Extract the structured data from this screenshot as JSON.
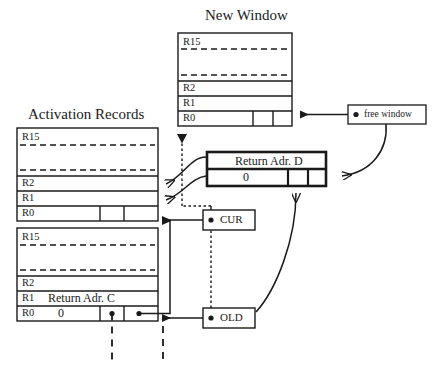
{
  "diagram": {
    "type": "register-window-activation-record-diagram",
    "titles": {
      "new_window": "New Window",
      "activation_records": "Activation Records"
    },
    "new_window": {
      "name": "New Window",
      "registers": [
        "R15",
        "R2",
        "R1",
        "R0"
      ],
      "dashed_separators": 2,
      "r0_cells": [
        "",
        "",
        ""
      ],
      "r1_value": "",
      "r0_value": ""
    },
    "activation_record_top": {
      "name": "Activation Record Top",
      "registers": [
        "R15",
        "R2",
        "R1",
        "R0"
      ],
      "dashed_separators": 2,
      "r1_value": "",
      "r0_value": "",
      "r0_cells": [
        "",
        "",
        ""
      ]
    },
    "activation_record_bottom": {
      "name": "Activation Record Bottom",
      "registers": [
        "R15",
        "R2",
        "R1",
        "R0"
      ],
      "dashed_separators": 2,
      "r1_value": "Return Adr. C",
      "r0_value": "0",
      "r0_cells": [
        "dot",
        "dot"
      ]
    },
    "return_adr_box": {
      "name": "Return Address D record",
      "top_label": "Return Adr. D",
      "bottom_value": "0",
      "cells": [
        "",
        ""
      ]
    },
    "pointers": [
      {
        "label": "free window",
        "id": "free-window"
      },
      {
        "label": "CUR",
        "id": "cur"
      },
      {
        "label": "OLD",
        "id": "old"
      }
    ],
    "colors": {
      "stroke": "#1a1a1a",
      "background": "#ffffff",
      "text": "#1a1a1a"
    }
  }
}
